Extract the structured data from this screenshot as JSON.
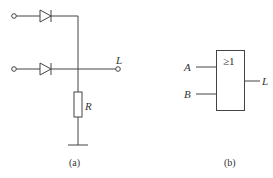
{
  "figure_a": {
    "caption": "(a)",
    "output_label": "L",
    "resistor_label": "R",
    "components": [
      "input-terminal-top",
      "diode-top",
      "input-terminal-bottom",
      "diode-bottom",
      "resistor",
      "ground",
      "output-terminal"
    ]
  },
  "figure_b": {
    "caption": "(b)",
    "gate_symbol": "≥1",
    "input_a_label": "A",
    "input_b_label": "B",
    "output_label": "L"
  },
  "colors": {
    "line": "#444444",
    "text": "#333333",
    "background": "#ffffff"
  }
}
